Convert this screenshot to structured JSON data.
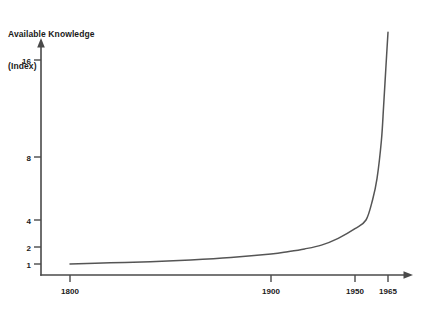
{
  "chart_data": {
    "type": "line",
    "title": "Available Knowledge (Index)",
    "title_lines": [
      "Available Knowledge",
      "(Index)"
    ],
    "xlabel": "",
    "ylabel": "Available Knowledge (Index)",
    "yscale": "log2",
    "grid": false,
    "legend": null,
    "xlim": [
      1800,
      1968
    ],
    "ylim": [
      1,
      20
    ],
    "x_ticks": [
      1800,
      1900,
      1950,
      1965
    ],
    "x_tick_labels": [
      "1800",
      "1900",
      "1950",
      "1965"
    ],
    "y_ticks": [
      1,
      2,
      4,
      8,
      16
    ],
    "y_tick_labels": [
      "1",
      "2",
      "4",
      "8",
      "16"
    ],
    "series": [
      {
        "name": "Available Knowledge",
        "x": [
          1800,
          1820,
          1840,
          1860,
          1880,
          1900,
          1910,
          1920,
          1930,
          1940,
          1950,
          1955,
          1958,
          1960,
          1962,
          1963,
          1964,
          1965
        ],
        "values": [
          1.0,
          1.05,
          1.1,
          1.18,
          1.3,
          1.5,
          1.65,
          1.85,
          2.1,
          2.5,
          3.2,
          4.0,
          5.0,
          6.3,
          9.0,
          11.5,
          15.0,
          19.5
        ]
      }
    ],
    "colors": {
      "curve": "#555555",
      "axis": "#4a4a4a",
      "text": "#1a1a1a",
      "background": "#ffffff"
    }
  }
}
